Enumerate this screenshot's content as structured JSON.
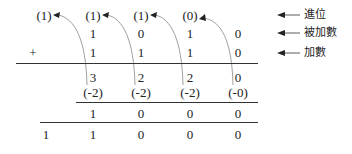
{
  "carry_row": [
    "(1)",
    "(1)",
    "(1)",
    "(0)"
  ],
  "augend_row": [
    "1",
    "0",
    "1",
    "0"
  ],
  "addend_row": [
    "1",
    "1",
    "1",
    "0"
  ],
  "plus_sign": "+",
  "sum_row": [
    "3",
    "2",
    "2",
    "0"
  ],
  "subtract_row": [
    "(-2)",
    "(-2)",
    "(-2)",
    "(-0)"
  ],
  "digit_row": [
    "1",
    "0",
    "0",
    "0"
  ],
  "result_row": [
    "1",
    "1",
    "0",
    "0",
    "0"
  ],
  "labels": {
    "carry": "進位",
    "augend": "被加數",
    "addend": "加數"
  }
}
